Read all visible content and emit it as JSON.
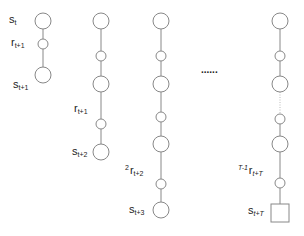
{
  "diagram": {
    "title": "",
    "stroke_color": "#888888",
    "node_fill": "#ffffff",
    "columns": [
      {
        "x": 43,
        "nodes": [
          {
            "type": "state",
            "y": 21
          },
          {
            "type": "reward",
            "y": 44
          },
          {
            "type": "state",
            "y": 75
          }
        ],
        "edges": [
          {
            "from": 0,
            "to": 1,
            "style": "solid"
          },
          {
            "from": 1,
            "to": 2,
            "style": "solid"
          }
        ]
      },
      {
        "x": 101,
        "nodes": [
          {
            "type": "state",
            "y": 21
          },
          {
            "type": "reward",
            "y": 56
          },
          {
            "type": "state",
            "y": 84
          },
          {
            "type": "reward",
            "y": 124
          },
          {
            "type": "state",
            "y": 152
          }
        ],
        "edges": [
          {
            "from": 0,
            "to": 1,
            "style": "solid"
          },
          {
            "from": 1,
            "to": 2,
            "style": "solid"
          },
          {
            "from": 2,
            "to": 3,
            "style": "solid"
          },
          {
            "from": 3,
            "to": 4,
            "style": "solid"
          }
        ]
      },
      {
        "x": 161,
        "nodes": [
          {
            "type": "state",
            "y": 21
          },
          {
            "type": "reward",
            "y": 56
          },
          {
            "type": "state",
            "y": 84
          },
          {
            "type": "reward",
            "y": 117
          },
          {
            "type": "state",
            "y": 144
          },
          {
            "type": "reward",
            "y": 184
          },
          {
            "type": "state",
            "y": 210
          }
        ],
        "edges": [
          {
            "from": 0,
            "to": 1,
            "style": "solid"
          },
          {
            "from": 1,
            "to": 2,
            "style": "solid"
          },
          {
            "from": 2,
            "to": 3,
            "style": "solid"
          },
          {
            "from": 3,
            "to": 4,
            "style": "solid"
          },
          {
            "from": 4,
            "to": 5,
            "style": "solid"
          },
          {
            "from": 5,
            "to": 6,
            "style": "solid"
          }
        ]
      },
      {
        "x": 280,
        "nodes": [
          {
            "type": "state",
            "y": 21
          },
          {
            "type": "reward",
            "y": 56
          },
          {
            "type": "state",
            "y": 84
          },
          {
            "type": "reward",
            "y": 119
          },
          {
            "type": "state",
            "y": 144
          },
          {
            "type": "reward",
            "y": 183
          },
          {
            "type": "terminal",
            "y": 213
          }
        ],
        "edges": [
          {
            "from": 0,
            "to": 1,
            "style": "solid"
          },
          {
            "from": 1,
            "to": 2,
            "style": "solid"
          },
          {
            "from": 2,
            "to": 3,
            "style": "dotted"
          },
          {
            "from": 3,
            "to": 4,
            "style": "solid"
          },
          {
            "from": 4,
            "to": 5,
            "style": "solid"
          },
          {
            "from": 5,
            "to": 6,
            "style": "solid"
          }
        ]
      }
    ],
    "ellipsis": "......",
    "labels": {
      "s_t": {
        "base": "s",
        "sub": "t",
        "sup": ""
      },
      "r_t1": {
        "base": "r",
        "sub": "t+1",
        "sup": ""
      },
      "s_t1": {
        "base": "s",
        "sub": "t+1",
        "sup": ""
      },
      "r_t1_col2": {
        "base": "r",
        "sub": "t+1",
        "sup": ""
      },
      "s_t2": {
        "base": "s",
        "sub": "t+2",
        "sup": ""
      },
      "r2_t2": {
        "base": "r",
        "sub": "t+2",
        "sup": "2"
      },
      "s_t3": {
        "base": "s",
        "sub": "t+3",
        "sup": ""
      },
      "rT_tT": {
        "base": "r",
        "sub": "t+T",
        "sup": "T-1"
      },
      "s_tT": {
        "base": "s",
        "sub": "t+T",
        "sup": ""
      }
    }
  }
}
